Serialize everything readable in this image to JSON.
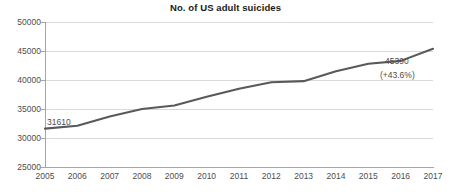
{
  "chart_data": {
    "type": "line",
    "title": "No. of US adult suicides",
    "xlabel": "",
    "ylabel": "",
    "categories": [
      "2005",
      "2006",
      "2007",
      "2008",
      "2009",
      "2010",
      "2011",
      "2012",
      "2013",
      "2014",
      "2015",
      "2016",
      "2017"
    ],
    "values": [
      31610,
      32100,
      33700,
      35000,
      35600,
      37100,
      38500,
      39600,
      39800,
      41500,
      42800,
      43300,
      45390
    ],
    "ylim": [
      25000,
      50000
    ],
    "yticks": [
      "25000",
      "30000",
      "35000",
      "40000",
      "45000",
      "50000"
    ],
    "ytick_values": [
      25000,
      30000,
      35000,
      40000,
      45000,
      50000
    ],
    "grid": true,
    "legend": "none",
    "series": [
      {
        "name": "No. of US adult suicides",
        "color": "#595959",
        "values": [
          31610,
          32100,
          33700,
          35000,
          35600,
          37100,
          38500,
          39600,
          39800,
          41500,
          42800,
          43300,
          45390
        ]
      }
    ],
    "annotations": [
      {
        "name": "first-point-value",
        "text": "31610",
        "year": "2005"
      },
      {
        "name": "last-point-value",
        "text": "45390",
        "year": "2017"
      },
      {
        "name": "last-point-change",
        "text": "(+43.6%)",
        "year": "2017"
      }
    ]
  },
  "colors": {
    "line": "#595959",
    "grid": "#d9d9d9",
    "axis": "#a6a6a6",
    "title_text": "#1a1a1a",
    "tick_text": "#4d4d4d",
    "background": "#ffffff"
  }
}
